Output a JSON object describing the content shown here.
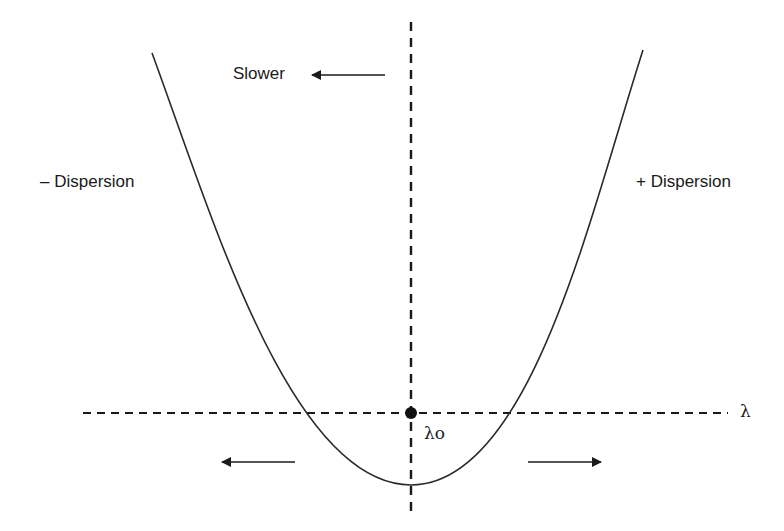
{
  "diagram": {
    "type": "dispersion-curve",
    "labels": {
      "slower": "Slower",
      "negative_dispersion": "– Dispersion",
      "positive_dispersion": "+ Dispersion",
      "lambda_axis": "λ",
      "lambda_zero": "λo"
    },
    "colors": {
      "line": "#1a1a1a",
      "background": "#ffffff"
    },
    "geometry": {
      "horizontal_axis_y": 413,
      "vertical_axis_x": 411,
      "curve_vertex": [
        411,
        485
      ],
      "curve_left_top": [
        152,
        53
      ],
      "curve_right_top": [
        643,
        50
      ],
      "zero_point": [
        411,
        413
      ]
    },
    "arrows": [
      {
        "name": "slower-arrow",
        "direction": "left",
        "from": [
          385,
          75
        ],
        "to": [
          312,
          75
        ]
      },
      {
        "name": "left-arrow",
        "direction": "left",
        "from": [
          295,
          462
        ],
        "to": [
          222,
          462
        ]
      },
      {
        "name": "right-arrow",
        "direction": "right",
        "from": [
          528,
          462
        ],
        "to": [
          601,
          462
        ]
      }
    ]
  }
}
